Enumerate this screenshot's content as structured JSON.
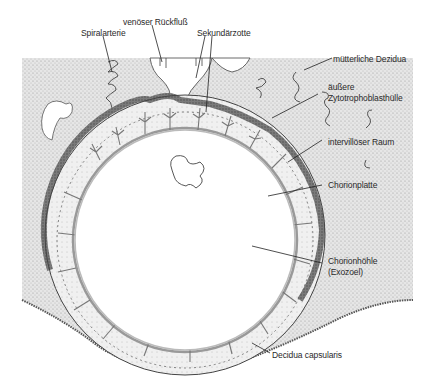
{
  "diagram": {
    "labels": {
      "spiral_artery": "Spiralarterie",
      "venous_return": "venöser Rückfluß",
      "secondary_villus": "Sekundärzotte",
      "maternal_decidua": "mütterliche Dezidua",
      "outer_cytotrophoblast_line1": "äußere",
      "outer_cytotrophoblast_line2": "Zytotrophoblasthülle",
      "intervillous_space": "intervillöser Raum",
      "chorionic_plate": "Chorionplatte",
      "chorionic_cavity_line1": "Chorionhöhle",
      "chorionic_cavity_line2": "(Exozoel)",
      "decidua_capsularis": "Decidua capsularis"
    },
    "colors": {
      "stipple": "#d8d8d8",
      "dark_shell": "#6a6a6a",
      "line": "#333333",
      "background": "#ffffff"
    }
  }
}
